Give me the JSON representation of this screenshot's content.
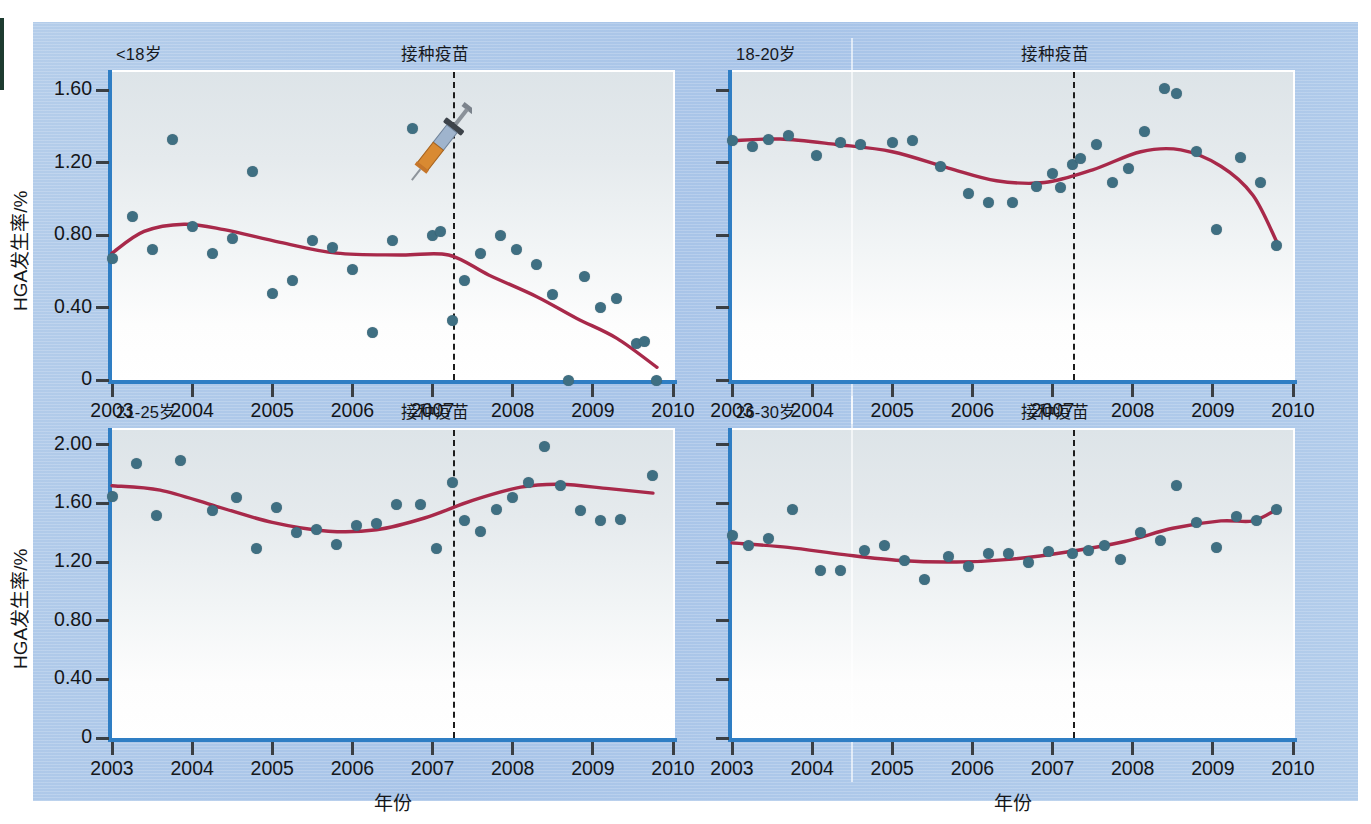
{
  "figure": {
    "background_color": "#aec8e8",
    "plot_background": "#eef2f4",
    "point_color": "#3f6f82",
    "trend_color": "#a8294a",
    "axis_color": "#2f7ec4",
    "vacc_line_color": "#1c1c1c"
  },
  "axis_titles": {
    "y": "HGA发生率/%",
    "x": "年份"
  },
  "annotation_label": "接种疫苗",
  "vaccination_year": 2007.25,
  "x_ticks": [
    "2003",
    "2004",
    "2005",
    "2006",
    "2007",
    "2008",
    "2009",
    "2010"
  ],
  "y_ticks_4": [
    "0",
    "0.40",
    "0.80",
    "1.20",
    "1.60"
  ],
  "y_ticks_5": [
    "0",
    "0.40",
    "0.80",
    "1.20",
    "1.60",
    "2.00"
  ],
  "chart_data": [
    {
      "type": "scatter",
      "panel": "A",
      "title": "<18岁",
      "annotation": "接种疫苗",
      "annotation_x": 2007.25,
      "xlabel": "年份",
      "ylabel": "HGA发生率/%",
      "xlim": [
        2003,
        2010
      ],
      "ylim": [
        0,
        1.7
      ],
      "y_ticks": [
        0,
        0.4,
        0.8,
        1.2,
        1.6
      ],
      "x_ticks": [
        2003,
        2004,
        2005,
        2006,
        2007,
        2008,
        2009,
        2010
      ],
      "grid": false,
      "legend": "none",
      "icon": "syringe-icon",
      "points": [
        {
          "x": 2003.0,
          "y": 0.67
        },
        {
          "x": 2003.25,
          "y": 0.9
        },
        {
          "x": 2003.5,
          "y": 0.72
        },
        {
          "x": 2003.75,
          "y": 1.33
        },
        {
          "x": 2004.0,
          "y": 0.85
        },
        {
          "x": 2004.25,
          "y": 0.7
        },
        {
          "x": 2004.5,
          "y": 0.78
        },
        {
          "x": 2004.75,
          "y": 1.15
        },
        {
          "x": 2005.0,
          "y": 0.48
        },
        {
          "x": 2005.25,
          "y": 0.55
        },
        {
          "x": 2005.5,
          "y": 0.77
        },
        {
          "x": 2005.75,
          "y": 0.73
        },
        {
          "x": 2006.0,
          "y": 0.61
        },
        {
          "x": 2006.25,
          "y": 0.26
        },
        {
          "x": 2006.5,
          "y": 0.77
        },
        {
          "x": 2006.75,
          "y": 1.39
        },
        {
          "x": 2007.0,
          "y": 0.8
        },
        {
          "x": 2007.1,
          "y": 0.82
        },
        {
          "x": 2007.25,
          "y": 0.33
        },
        {
          "x": 2007.4,
          "y": 0.55
        },
        {
          "x": 2007.6,
          "y": 0.7
        },
        {
          "x": 2007.85,
          "y": 0.8
        },
        {
          "x": 2008.05,
          "y": 0.72
        },
        {
          "x": 2008.3,
          "y": 0.64
        },
        {
          "x": 2008.5,
          "y": 0.47
        },
        {
          "x": 2008.7,
          "y": 0.0
        },
        {
          "x": 2008.9,
          "y": 0.57
        },
        {
          "x": 2009.1,
          "y": 0.4
        },
        {
          "x": 2009.3,
          "y": 0.45
        },
        {
          "x": 2009.55,
          "y": 0.2
        },
        {
          "x": 2009.65,
          "y": 0.21
        },
        {
          "x": 2009.8,
          "y": 0.0
        }
      ],
      "trend": [
        {
          "x": 2003.0,
          "y": 0.7
        },
        {
          "x": 2003.4,
          "y": 0.82
        },
        {
          "x": 2003.9,
          "y": 0.86
        },
        {
          "x": 2004.4,
          "y": 0.83
        },
        {
          "x": 2005.1,
          "y": 0.76
        },
        {
          "x": 2005.8,
          "y": 0.7
        },
        {
          "x": 2006.6,
          "y": 0.69
        },
        {
          "x": 2007.2,
          "y": 0.69
        },
        {
          "x": 2007.7,
          "y": 0.58
        },
        {
          "x": 2008.3,
          "y": 0.46
        },
        {
          "x": 2008.8,
          "y": 0.34
        },
        {
          "x": 2009.3,
          "y": 0.23
        },
        {
          "x": 2009.8,
          "y": 0.07
        }
      ]
    },
    {
      "type": "scatter",
      "panel": "B",
      "title": "18-20岁",
      "annotation": "接种疫苗",
      "annotation_x": 2007.25,
      "xlabel": "年份",
      "ylabel": "HGA发生率/%",
      "xlim": [
        2003,
        2010
      ],
      "ylim": [
        0,
        1.7
      ],
      "y_ticks": [
        0,
        0.4,
        0.8,
        1.2,
        1.6
      ],
      "x_ticks": [
        2003,
        2004,
        2005,
        2006,
        2007,
        2008,
        2009,
        2010
      ],
      "grid": false,
      "legend": "none",
      "points": [
        {
          "x": 2003.0,
          "y": 1.32
        },
        {
          "x": 2003.25,
          "y": 1.29
        },
        {
          "x": 2003.45,
          "y": 1.33
        },
        {
          "x": 2003.7,
          "y": 1.35
        },
        {
          "x": 2004.05,
          "y": 1.24
        },
        {
          "x": 2004.35,
          "y": 1.31
        },
        {
          "x": 2004.6,
          "y": 1.3
        },
        {
          "x": 2005.0,
          "y": 1.31
        },
        {
          "x": 2005.25,
          "y": 1.32
        },
        {
          "x": 2005.6,
          "y": 1.18
        },
        {
          "x": 2005.95,
          "y": 1.03
        },
        {
          "x": 2006.2,
          "y": 0.98
        },
        {
          "x": 2006.5,
          "y": 0.98
        },
        {
          "x": 2006.8,
          "y": 1.07
        },
        {
          "x": 2007.0,
          "y": 1.14
        },
        {
          "x": 2007.1,
          "y": 1.06
        },
        {
          "x": 2007.25,
          "y": 1.19
        },
        {
          "x": 2007.35,
          "y": 1.22
        },
        {
          "x": 2007.55,
          "y": 1.3
        },
        {
          "x": 2007.75,
          "y": 1.09
        },
        {
          "x": 2007.95,
          "y": 1.17
        },
        {
          "x": 2008.15,
          "y": 1.37
        },
        {
          "x": 2008.4,
          "y": 1.61
        },
        {
          "x": 2008.55,
          "y": 1.58
        },
        {
          "x": 2008.8,
          "y": 1.26
        },
        {
          "x": 2009.05,
          "y": 0.83
        },
        {
          "x": 2009.35,
          "y": 1.23
        },
        {
          "x": 2009.6,
          "y": 1.09
        },
        {
          "x": 2009.8,
          "y": 0.74
        }
      ],
      "trend": [
        {
          "x": 2003.0,
          "y": 1.32
        },
        {
          "x": 2003.6,
          "y": 1.33
        },
        {
          "x": 2004.3,
          "y": 1.3
        },
        {
          "x": 2005.0,
          "y": 1.26
        },
        {
          "x": 2005.7,
          "y": 1.17
        },
        {
          "x": 2006.3,
          "y": 1.1
        },
        {
          "x": 2006.9,
          "y": 1.09
        },
        {
          "x": 2007.5,
          "y": 1.16
        },
        {
          "x": 2008.1,
          "y": 1.26
        },
        {
          "x": 2008.6,
          "y": 1.27
        },
        {
          "x": 2009.1,
          "y": 1.18
        },
        {
          "x": 2009.5,
          "y": 1.02
        },
        {
          "x": 2009.8,
          "y": 0.76
        }
      ]
    },
    {
      "type": "scatter",
      "panel": "C",
      "title": "21-25岁",
      "annotation": "接种疫苗",
      "annotation_x": 2007.25,
      "xlabel": "年份",
      "ylabel": "HGA发生率/%",
      "xlim": [
        2003,
        2010
      ],
      "ylim": [
        0,
        2.1
      ],
      "y_ticks": [
        0,
        0.4,
        0.8,
        1.2,
        1.6,
        2.0
      ],
      "x_ticks": [
        2003,
        2004,
        2005,
        2006,
        2007,
        2008,
        2009,
        2010
      ],
      "grid": false,
      "legend": "none",
      "points": [
        {
          "x": 2003.0,
          "y": 1.65
        },
        {
          "x": 2003.3,
          "y": 1.87
        },
        {
          "x": 2003.55,
          "y": 1.52
        },
        {
          "x": 2003.85,
          "y": 1.89
        },
        {
          "x": 2004.25,
          "y": 1.55
        },
        {
          "x": 2004.55,
          "y": 1.64
        },
        {
          "x": 2004.8,
          "y": 1.29
        },
        {
          "x": 2005.05,
          "y": 1.57
        },
        {
          "x": 2005.3,
          "y": 1.4
        },
        {
          "x": 2005.55,
          "y": 1.42
        },
        {
          "x": 2005.8,
          "y": 1.32
        },
        {
          "x": 2006.05,
          "y": 1.45
        },
        {
          "x": 2006.3,
          "y": 1.46
        },
        {
          "x": 2006.55,
          "y": 1.59
        },
        {
          "x": 2006.85,
          "y": 1.59
        },
        {
          "x": 2007.05,
          "y": 1.29
        },
        {
          "x": 2007.25,
          "y": 1.74
        },
        {
          "x": 2007.4,
          "y": 1.48
        },
        {
          "x": 2007.6,
          "y": 1.41
        },
        {
          "x": 2007.8,
          "y": 1.56
        },
        {
          "x": 2008.0,
          "y": 1.64
        },
        {
          "x": 2008.2,
          "y": 1.74
        },
        {
          "x": 2008.4,
          "y": 1.99
        },
        {
          "x": 2008.6,
          "y": 1.72
        },
        {
          "x": 2008.85,
          "y": 1.55
        },
        {
          "x": 2009.1,
          "y": 1.48
        },
        {
          "x": 2009.35,
          "y": 1.49
        },
        {
          "x": 2009.75,
          "y": 1.79
        }
      ],
      "trend": [
        {
          "x": 2003.0,
          "y": 1.72
        },
        {
          "x": 2003.6,
          "y": 1.69
        },
        {
          "x": 2004.3,
          "y": 1.58
        },
        {
          "x": 2005.0,
          "y": 1.47
        },
        {
          "x": 2005.7,
          "y": 1.41
        },
        {
          "x": 2006.3,
          "y": 1.42
        },
        {
          "x": 2006.9,
          "y": 1.5
        },
        {
          "x": 2007.5,
          "y": 1.62
        },
        {
          "x": 2008.1,
          "y": 1.71
        },
        {
          "x": 2008.6,
          "y": 1.73
        },
        {
          "x": 2009.2,
          "y": 1.7
        },
        {
          "x": 2009.75,
          "y": 1.67
        }
      ]
    },
    {
      "type": "scatter",
      "panel": "D",
      "title": "26-30岁",
      "annotation": "接种疫苗",
      "annotation_x": 2007.25,
      "xlabel": "年份",
      "ylabel": "HGA发生率/%",
      "xlim": [
        2003,
        2010
      ],
      "ylim": [
        0,
        2.1
      ],
      "y_ticks": [
        0,
        0.4,
        0.8,
        1.2,
        1.6,
        2.0
      ],
      "x_ticks": [
        2003,
        2004,
        2005,
        2006,
        2007,
        2008,
        2009,
        2010
      ],
      "grid": false,
      "legend": "none",
      "points": [
        {
          "x": 2003.0,
          "y": 1.38
        },
        {
          "x": 2003.2,
          "y": 1.31
        },
        {
          "x": 2003.45,
          "y": 1.36
        },
        {
          "x": 2003.75,
          "y": 1.56
        },
        {
          "x": 2004.1,
          "y": 1.14
        },
        {
          "x": 2004.35,
          "y": 1.14
        },
        {
          "x": 2004.65,
          "y": 1.28
        },
        {
          "x": 2004.9,
          "y": 1.31
        },
        {
          "x": 2005.15,
          "y": 1.21
        },
        {
          "x": 2005.4,
          "y": 1.08
        },
        {
          "x": 2005.7,
          "y": 1.24
        },
        {
          "x": 2005.95,
          "y": 1.17
        },
        {
          "x": 2006.2,
          "y": 1.26
        },
        {
          "x": 2006.45,
          "y": 1.26
        },
        {
          "x": 2006.7,
          "y": 1.2
        },
        {
          "x": 2006.95,
          "y": 1.27
        },
        {
          "x": 2007.25,
          "y": 1.26
        },
        {
          "x": 2007.45,
          "y": 1.28
        },
        {
          "x": 2007.65,
          "y": 1.31
        },
        {
          "x": 2007.85,
          "y": 1.22
        },
        {
          "x": 2008.1,
          "y": 1.4
        },
        {
          "x": 2008.35,
          "y": 1.35
        },
        {
          "x": 2008.55,
          "y": 1.72
        },
        {
          "x": 2008.8,
          "y": 1.47
        },
        {
          "x": 2009.05,
          "y": 1.3
        },
        {
          "x": 2009.3,
          "y": 1.51
        },
        {
          "x": 2009.55,
          "y": 1.48
        },
        {
          "x": 2009.8,
          "y": 1.56
        }
      ],
      "trend": [
        {
          "x": 2003.0,
          "y": 1.33
        },
        {
          "x": 2003.7,
          "y": 1.3
        },
        {
          "x": 2004.4,
          "y": 1.25
        },
        {
          "x": 2005.1,
          "y": 1.21
        },
        {
          "x": 2005.8,
          "y": 1.2
        },
        {
          "x": 2006.5,
          "y": 1.22
        },
        {
          "x": 2007.2,
          "y": 1.27
        },
        {
          "x": 2007.9,
          "y": 1.34
        },
        {
          "x": 2008.5,
          "y": 1.43
        },
        {
          "x": 2009.1,
          "y": 1.48
        },
        {
          "x": 2009.5,
          "y": 1.48
        },
        {
          "x": 2009.8,
          "y": 1.56
        }
      ]
    }
  ]
}
